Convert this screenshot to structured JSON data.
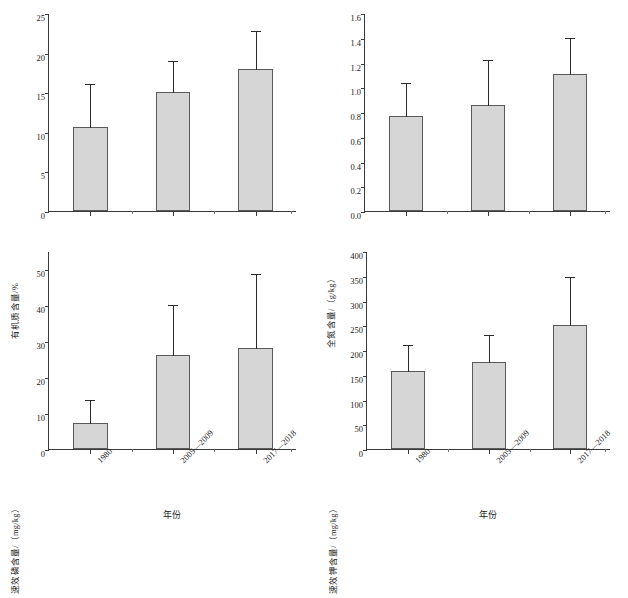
{
  "figure": {
    "background": "#ffffff",
    "bar_fill": "#d6d6d6",
    "bar_stroke": "#5a5a5a",
    "axis_color": "#3a3a3a",
    "error_color": "#2b2b2b"
  },
  "chart_data": [
    {
      "id": "organic-matter",
      "type": "bar",
      "title": "",
      "position": "top-left",
      "categories": [
        "1980",
        "2005—2009",
        "2017—2018"
      ],
      "values": [
        10.6,
        15.0,
        17.9
      ],
      "errors_upper": [
        16.1,
        19.1,
        22.9
      ],
      "xlabel": "",
      "ylabel": "有机质含量/%",
      "ylim": [
        0,
        25
      ],
      "yticks": [
        0,
        5,
        10,
        15,
        20,
        25
      ],
      "ytick_labels": [
        "0",
        "5",
        "10",
        "15",
        "20",
        "25"
      ],
      "grid": false,
      "legend": "none",
      "error_style": "upper-only"
    },
    {
      "id": "total-nitrogen",
      "type": "bar",
      "title": "",
      "position": "top-right",
      "categories": [
        "1980",
        "2005—2009",
        "2017—2018"
      ],
      "values": [
        0.77,
        0.86,
        1.11
      ],
      "errors_upper": [
        1.04,
        1.23,
        1.41
      ],
      "xlabel": "",
      "ylabel": "全氮含量/（g/kg）",
      "ylim": [
        0,
        1.6
      ],
      "yticks": [
        0,
        0.2,
        0.4,
        0.6,
        0.8,
        1.0,
        1.2,
        1.4,
        1.6
      ],
      "ytick_labels": [
        "0.0",
        "0.2",
        "0.4",
        "0.6",
        "0.8",
        "1.0",
        "1.2",
        "1.4",
        "1.6"
      ],
      "grid": false,
      "legend": "none",
      "error_style": "upper-only"
    },
    {
      "id": "available-phosphorus",
      "type": "bar",
      "title": "",
      "position": "bottom-left",
      "categories": [
        "1980",
        "2005—2009",
        "2017—2018"
      ],
      "values": [
        7.3,
        26.0,
        28.0
      ],
      "errors_upper": [
        14.0,
        40.2,
        49.0
      ],
      "xlabel": "年份",
      "ylabel": "速效磷含量/（mg/kg）",
      "ylim": [
        0,
        55
      ],
      "yticks": [
        0,
        10,
        20,
        30,
        40,
        50
      ],
      "ytick_labels": [
        "0",
        "10",
        "20",
        "30",
        "40",
        "50"
      ],
      "grid": false,
      "legend": "none",
      "error_style": "upper-only"
    },
    {
      "id": "available-potassium",
      "type": "bar",
      "title": "",
      "position": "bottom-right",
      "categories": [
        "1980",
        "2005—2009",
        "2017—2018"
      ],
      "values": [
        157,
        175,
        250
      ],
      "errors_upper": [
        212,
        233,
        350
      ],
      "xlabel": "年份",
      "ylabel": "速效钾含量/（mg/kg）",
      "ylim": [
        0,
        400
      ],
      "yticks": [
        0,
        50,
        100,
        150,
        200,
        250,
        300,
        350,
        400
      ],
      "ytick_labels": [
        "0",
        "50",
        "100",
        "150",
        "200",
        "250",
        "300",
        "350",
        "400"
      ],
      "grid": false,
      "legend": "none",
      "error_style": "upper-only"
    }
  ]
}
